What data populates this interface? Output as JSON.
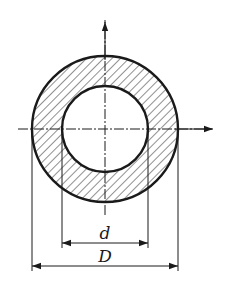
{
  "figure": {
    "labels": {
      "inner_diameter": "d",
      "outer_diameter": "D"
    },
    "colors": {
      "stroke": "#1a1a1a",
      "hatch": "#333333",
      "background": "#ffffff"
    }
  }
}
